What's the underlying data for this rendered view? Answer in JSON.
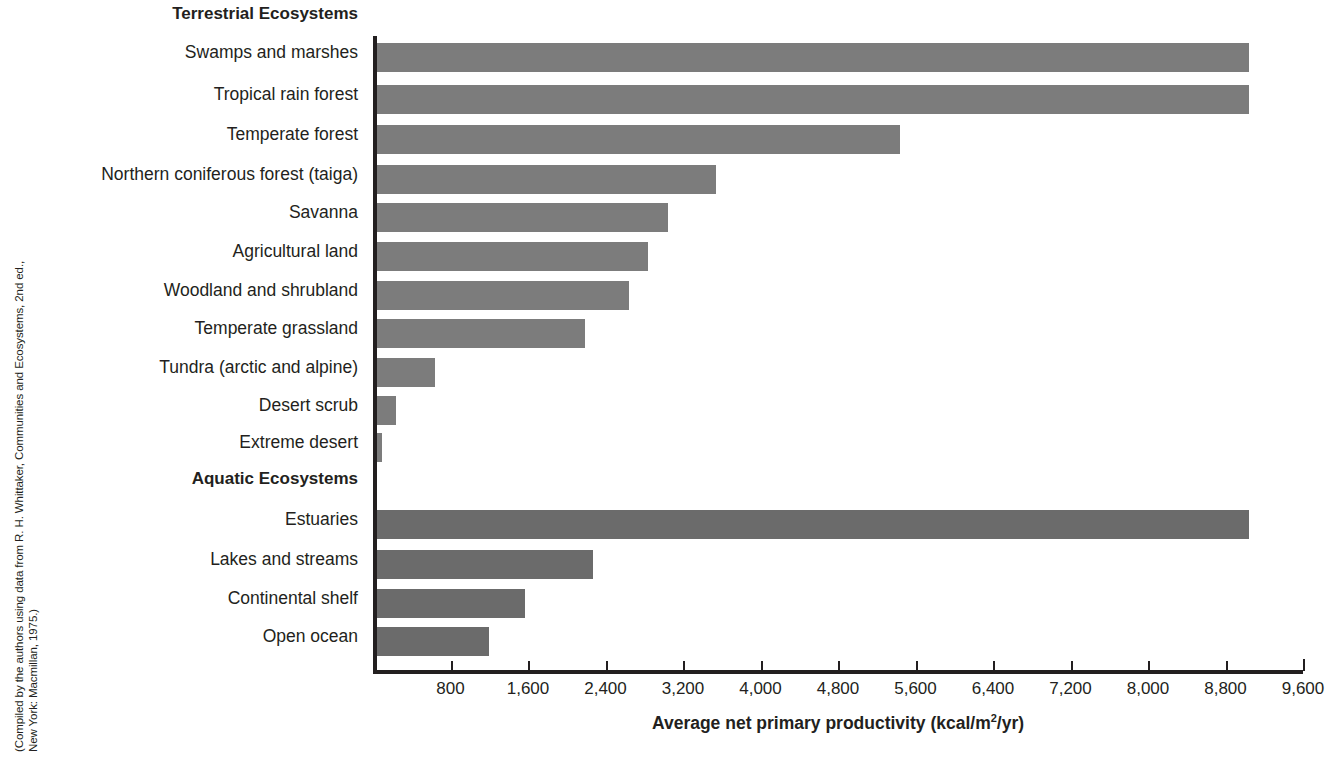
{
  "source_credit": {
    "line1": "(Compiled by the authors using data from R. H. Whittaker, Communities and Ecosystems, 2nd ed.,",
    "line2": "New York: Macmillan, 1975.)"
  },
  "axis_title": {
    "prefix": "Average net primary productivity (kcal/m",
    "exponent": "2",
    "suffix": "/yr)"
  },
  "chart_data": {
    "type": "bar",
    "orientation": "horizontal",
    "title": "",
    "xlabel": "Average net primary productivity (kcal/m2/yr)",
    "ylabel": "",
    "xlim": [
      0,
      9600
    ],
    "xticks": [
      0,
      800,
      1600,
      2400,
      3200,
      4000,
      4800,
      5600,
      6400,
      7200,
      8000,
      8800,
      9600
    ],
    "xtick_labels": [
      "",
      "800",
      "1,600",
      "2,400",
      "3,200",
      "4,000",
      "4,800",
      "5,600",
      "6,400",
      "7,200",
      "8,000",
      "8,800",
      "9,600"
    ],
    "grid": false,
    "legend": "none",
    "bar_color_terrestrial": "#7c7c7c",
    "bar_color_aquatic": "#6b6b6b",
    "groups": [
      {
        "name": "Terrestrial Ecosystems",
        "categories": [
          "Swamps and marshes",
          "Tropical rain forest",
          "Temperate forest",
          "Northern coniferous forest (taiga)",
          "Savanna",
          "Agricultural land",
          "Woodland and shrubland",
          "Temperate grassland",
          "Tundra (arctic and alpine)",
          "Desert scrub",
          "Extreme desert"
        ],
        "values": [
          9000,
          9000,
          5400,
          3500,
          3000,
          2800,
          2600,
          2150,
          600,
          200,
          50
        ]
      },
      {
        "name": "Aquatic Ecosystems",
        "categories": [
          "Estuaries",
          "Lakes and streams",
          "Continental shelf",
          "Open ocean"
        ],
        "values": [
          9000,
          2230,
          1530,
          1160
        ]
      }
    ]
  },
  "rows": [
    {
      "label": "Terrestrial Ecosystems",
      "kind": "group",
      "top": 4
    },
    {
      "label": "Swamps and marshes",
      "kind": "bar",
      "top": 42,
      "value": 9000,
      "series": "terrestrial"
    },
    {
      "label": "Tropical rain forest",
      "kind": "bar",
      "top": 84,
      "value": 9000,
      "series": "terrestrial"
    },
    {
      "label": "Temperate forest",
      "kind": "bar",
      "top": 124,
      "value": 5400,
      "series": "terrestrial"
    },
    {
      "label": "Northern coniferous forest (taiga)",
      "kind": "bar",
      "top": 164,
      "value": 3500,
      "series": "terrestrial"
    },
    {
      "label": "Savanna",
      "kind": "bar",
      "top": 202,
      "value": 3000,
      "series": "terrestrial"
    },
    {
      "label": "Agricultural land",
      "kind": "bar",
      "top": 241,
      "value": 2800,
      "series": "terrestrial"
    },
    {
      "label": "Woodland and shrubland",
      "kind": "bar",
      "top": 280,
      "value": 2600,
      "series": "terrestrial"
    },
    {
      "label": "Temperate grassland",
      "kind": "bar",
      "top": 318,
      "value": 2150,
      "series": "terrestrial"
    },
    {
      "label": "Tundra (arctic and alpine)",
      "kind": "bar",
      "top": 357,
      "value": 600,
      "series": "terrestrial"
    },
    {
      "label": "Desert scrub",
      "kind": "bar",
      "top": 395,
      "value": 200,
      "series": "terrestrial"
    },
    {
      "label": "Extreme desert",
      "kind": "bar",
      "top": 432,
      "value": 50,
      "series": "terrestrial"
    },
    {
      "label": "Aquatic Ecosystems",
      "kind": "group",
      "top": 469
    },
    {
      "label": "Estuaries",
      "kind": "bar",
      "top": 509,
      "value": 9000,
      "series": "aquatic"
    },
    {
      "label": "Lakes and streams",
      "kind": "bar",
      "top": 549,
      "value": 2230,
      "series": "aquatic"
    },
    {
      "label": "Continental shelf",
      "kind": "bar",
      "top": 588,
      "value": 1530,
      "series": "aquatic"
    },
    {
      "label": "Open ocean",
      "kind": "bar",
      "top": 626,
      "value": 1160,
      "series": "aquatic"
    }
  ]
}
